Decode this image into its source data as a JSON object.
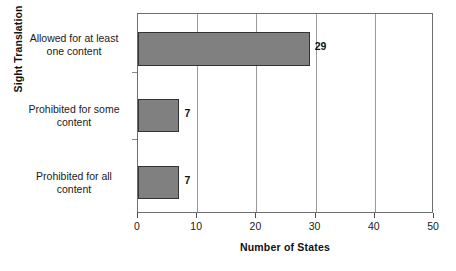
{
  "chart_data": {
    "type": "bar",
    "orientation": "horizontal",
    "title": "",
    "xlabel": "Number of States",
    "ylabel": "Sight Translation",
    "categories": [
      "Allowed for at least one content",
      "Prohibited for some content",
      "Prohibited for all content"
    ],
    "category_lines": [
      [
        "Allowed for at least",
        "one content"
      ],
      [
        "Prohibited for some",
        "content"
      ],
      [
        "Prohibited for all",
        "content"
      ]
    ],
    "values": [
      29,
      7,
      7
    ],
    "value_labels": [
      "29",
      "7",
      "7"
    ],
    "xlim": [
      0,
      50
    ],
    "xticks": [
      0,
      10,
      20,
      30,
      40,
      50
    ],
    "xtick_labels": [
      "0",
      "10",
      "20",
      "30",
      "40",
      "50"
    ],
    "grid": true,
    "grid_axis": "x",
    "legend": false,
    "bar_color": "#808080",
    "bar_border_color": "#333333",
    "frame_color": "#6e6e6e",
    "gridline_color": "#9a9a9a",
    "text_color": "#1a1a1a",
    "background": "#ffffff"
  }
}
